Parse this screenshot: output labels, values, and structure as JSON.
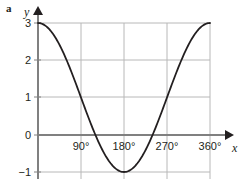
{
  "figure": {
    "part_label": "a"
  },
  "chart_data": {
    "type": "line",
    "title": "",
    "subtitle": "",
    "xlabel": "x",
    "ylabel": "y",
    "function": "y = 2cos(x) + 1",
    "xlim": [
      0,
      360
    ],
    "ylim": [
      -1,
      3
    ],
    "grid": true,
    "legend": null,
    "x_tick_labels": [
      "90°",
      "180°",
      "270°",
      "360°"
    ],
    "x_tick_values": [
      90,
      180,
      270,
      360
    ],
    "y_tick_labels": [
      "3",
      "2",
      "1",
      "0",
      "−1"
    ],
    "y_tick_values": [
      3,
      2,
      1,
      0,
      -1
    ],
    "series": [
      {
        "name": "y = 2cos(x) + 1",
        "color": "#231f20",
        "x": [
          0,
          10,
          20,
          30,
          40,
          50,
          60,
          70,
          80,
          90,
          100,
          110,
          120,
          130,
          140,
          150,
          160,
          170,
          180,
          190,
          200,
          210,
          220,
          230,
          240,
          250,
          260,
          270,
          280,
          290,
          300,
          310,
          320,
          330,
          340,
          350,
          360
        ],
        "values": [
          3,
          2.97,
          2.88,
          2.73,
          2.53,
          2.29,
          2,
          1.68,
          1.35,
          1,
          0.65,
          0.32,
          0,
          -0.29,
          -0.53,
          -0.73,
          -0.88,
          -0.97,
          -1,
          -0.97,
          -0.88,
          -0.73,
          -0.53,
          -0.29,
          0,
          0.32,
          0.65,
          1,
          1.35,
          1.68,
          2,
          2.29,
          2.53,
          2.73,
          2.88,
          2.97,
          3
        ]
      }
    ],
    "colors": {
      "curve": "#231f20",
      "grid": "#b8b8b8",
      "axis": "#808080",
      "text": "#231f20"
    }
  }
}
